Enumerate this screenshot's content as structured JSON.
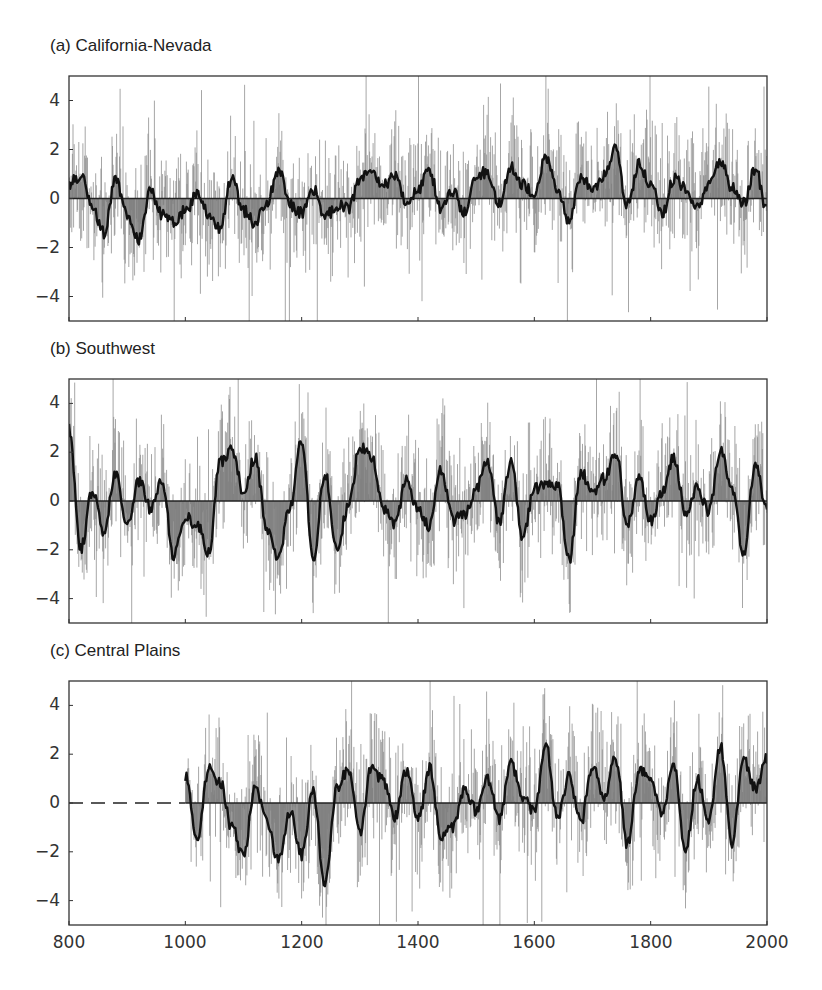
{
  "chart_data": [
    {
      "type": "line",
      "title": "(a) California-Nevada",
      "xlabel": "",
      "ylabel": "",
      "xlim": [
        800,
        2000
      ],
      "ylim": [
        -5,
        5
      ],
      "xticks": [
        800,
        1000,
        1200,
        1400,
        1600,
        1800,
        2000
      ],
      "yticks": [
        4,
        2,
        0,
        -2,
        -4
      ],
      "grid": false,
      "legend": null,
      "data_start": 800,
      "series": [
        {
          "name": "annual",
          "style": "thin gray vertical bars (annual values, range approx -5 to 5)"
        },
        {
          "name": "smoothed",
          "style": "thick black line, area to zero shaded gray",
          "x": [
            800,
            820,
            840,
            860,
            880,
            900,
            920,
            940,
            960,
            980,
            1000,
            1020,
            1040,
            1060,
            1080,
            1100,
            1120,
            1140,
            1160,
            1180,
            1200,
            1220,
            1240,
            1260,
            1280,
            1300,
            1320,
            1340,
            1360,
            1380,
            1400,
            1420,
            1440,
            1460,
            1480,
            1500,
            1520,
            1540,
            1560,
            1580,
            1600,
            1620,
            1640,
            1660,
            1680,
            1700,
            1720,
            1740,
            1760,
            1780,
            1800,
            1820,
            1840,
            1860,
            1880,
            1900,
            1920,
            1940,
            1960,
            1980,
            2000
          ],
          "values": [
            0.6,
            0.9,
            -0.3,
            -1.4,
            0.7,
            -0.6,
            -1.7,
            0.3,
            -0.7,
            -0.9,
            -0.5,
            0.2,
            -0.6,
            -1.2,
            0.9,
            -0.5,
            -1.0,
            -0.2,
            1.2,
            -0.3,
            -0.6,
            0.4,
            -0.8,
            -0.3,
            -0.4,
            0.7,
            1.2,
            0.5,
            0.9,
            -0.1,
            0.4,
            1.1,
            -0.4,
            0.3,
            -0.6,
            0.9,
            1.1,
            -0.2,
            1.3,
            0.6,
            0.2,
            1.7,
            0.3,
            -0.9,
            0.9,
            0.3,
            1.0,
            2.0,
            -0.3,
            1.4,
            0.6,
            -0.6,
            0.8,
            0.4,
            -0.4,
            0.6,
            1.6,
            0.4,
            -0.2,
            1.2,
            -0.5
          ]
        }
      ]
    },
    {
      "type": "line",
      "title": "(b) Southwest",
      "xlabel": "",
      "ylabel": "",
      "xlim": [
        800,
        2000
      ],
      "ylim": [
        -5,
        5
      ],
      "xticks": [
        800,
        1000,
        1200,
        1400,
        1600,
        1800,
        2000
      ],
      "yticks": [
        4,
        2,
        0,
        -2,
        -4
      ],
      "grid": false,
      "legend": null,
      "data_start": 800,
      "series": [
        {
          "name": "annual",
          "style": "thin gray vertical bars (annual values, range approx -5 to 5)"
        },
        {
          "name": "smoothed",
          "style": "thick black line, area to zero shaded gray",
          "x": [
            800,
            820,
            840,
            860,
            880,
            900,
            920,
            940,
            960,
            980,
            1000,
            1020,
            1040,
            1060,
            1080,
            1100,
            1120,
            1140,
            1160,
            1180,
            1200,
            1220,
            1240,
            1260,
            1280,
            1300,
            1320,
            1340,
            1360,
            1380,
            1400,
            1420,
            1440,
            1460,
            1480,
            1500,
            1520,
            1540,
            1560,
            1580,
            1600,
            1620,
            1640,
            1660,
            1680,
            1700,
            1720,
            1740,
            1760,
            1780,
            1800,
            1820,
            1840,
            1860,
            1880,
            1900,
            1920,
            1940,
            1960,
            1980,
            2000
          ],
          "values": [
            3.0,
            -2.0,
            0.4,
            -1.3,
            1.2,
            -1.0,
            0.8,
            -0.3,
            0.8,
            -2.2,
            -0.6,
            -1.0,
            -2.1,
            1.6,
            2.1,
            0.4,
            1.8,
            -1.1,
            -2.3,
            -0.3,
            2.5,
            -2.4,
            1.2,
            -1.9,
            -0.3,
            2.2,
            1.8,
            -0.3,
            -0.9,
            0.8,
            -0.4,
            -1.0,
            1.3,
            -0.8,
            -0.5,
            0.5,
            1.6,
            -1.0,
            1.7,
            -1.6,
            0.5,
            0.7,
            0.6,
            -2.4,
            1.2,
            0.3,
            0.9,
            2.0,
            -1.0,
            0.9,
            -0.8,
            0.3,
            1.8,
            -0.5,
            0.5,
            -0.4,
            2.1,
            0.4,
            -2.1,
            1.6,
            -0.3
          ]
        }
      ]
    },
    {
      "type": "line",
      "title": "(c) Central Plains",
      "xlabel": "",
      "ylabel": "",
      "xlim": [
        800,
        2000
      ],
      "ylim": [
        -5,
        5
      ],
      "xticks": [
        800,
        1000,
        1200,
        1400,
        1600,
        1800,
        2000
      ],
      "yticks": [
        4,
        2,
        0,
        -2,
        -4
      ],
      "grid": false,
      "legend": null,
      "data_start": 1000,
      "note": "dashed zero line from 800 to 1000 (no data)",
      "series": [
        {
          "name": "annual",
          "style": "thin gray vertical bars (annual values, range approx -5 to 5)"
        },
        {
          "name": "smoothed",
          "style": "thick black line, area to zero shaded gray",
          "x": [
            1000,
            1020,
            1040,
            1060,
            1080,
            1100,
            1120,
            1140,
            1160,
            1180,
            1200,
            1220,
            1240,
            1260,
            1280,
            1300,
            1320,
            1340,
            1360,
            1380,
            1400,
            1420,
            1440,
            1460,
            1480,
            1500,
            1520,
            1540,
            1560,
            1580,
            1600,
            1620,
            1640,
            1660,
            1680,
            1700,
            1720,
            1740,
            1760,
            1780,
            1800,
            1820,
            1840,
            1860,
            1880,
            1900,
            1920,
            1940,
            1960,
            1980,
            2000
          ],
          "values": [
            1.1,
            -1.5,
            1.4,
            0.9,
            -1.0,
            -2.2,
            0.7,
            -0.8,
            -2.4,
            -0.4,
            -2.1,
            0.5,
            -3.4,
            0.6,
            1.4,
            -1.2,
            1.5,
            0.9,
            -0.6,
            1.3,
            -0.7,
            1.4,
            -1.5,
            -1.0,
            0.6,
            -0.3,
            1.0,
            -0.7,
            1.6,
            0.3,
            -0.4,
            2.3,
            -0.6,
            1.1,
            -0.8,
            1.6,
            0.3,
            1.8,
            -1.7,
            1.3,
            1.0,
            -0.5,
            1.6,
            -2.0,
            1.0,
            -0.8,
            2.3,
            -1.6,
            1.8,
            0.6,
            1.8
          ]
        }
      ]
    }
  ],
  "labels": {
    "panel_a": "(a) California-Nevada",
    "panel_b": "(b) Southwest",
    "panel_c": "(c) Central Plains",
    "yticks": [
      "4",
      "2",
      "0",
      "−2",
      "−4"
    ],
    "xticks": [
      "800",
      "1000",
      "1200",
      "1400",
      "1600",
      "1800",
      "2000"
    ]
  },
  "colors": {
    "annual_bars": "#8a8a8a",
    "smoothed_line": "#111111",
    "shading": "#7a7a7a",
    "frame": "#333333"
  }
}
